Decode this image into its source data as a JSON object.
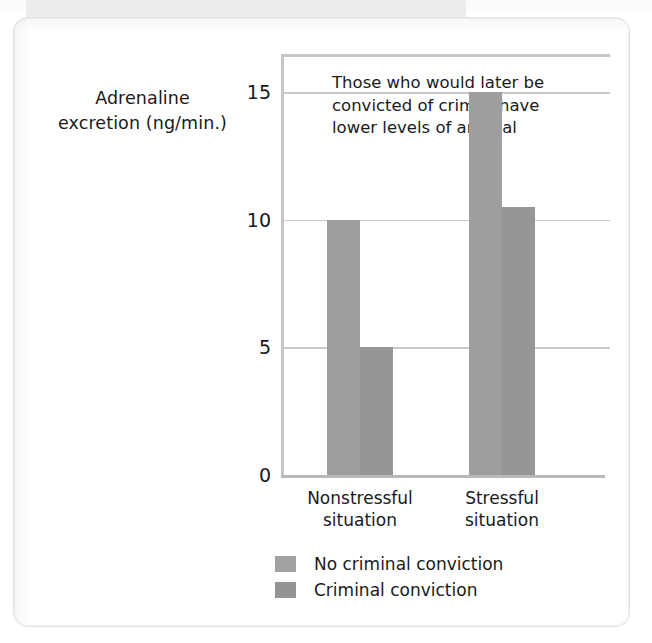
{
  "figure": {
    "y_axis_title_line1": "Adrenaline",
    "y_axis_title_line2": "excretion (ng/min.)",
    "annotation_line1": "Those who would later be",
    "annotation_line2": "convicted of crimes have",
    "annotation_line3": "lower levels of arousal"
  },
  "legend": {
    "items": [
      {
        "label": "No criminal conviction",
        "color": "#a2a2a2"
      },
      {
        "label": "Criminal conviction",
        "color": "#949494"
      }
    ]
  },
  "xticks": [
    {
      "line1": "Nonstressful",
      "line2": "situation"
    },
    {
      "line1": "Stressful",
      "line2": "situation"
    }
  ],
  "yticks": [
    "15",
    "10",
    "5",
    "0"
  ],
  "chart_data": {
    "type": "bar",
    "title": "",
    "annotation": "Those who would later be convicted of crimes have lower levels of arousal",
    "xlabel": "",
    "ylabel": "Adrenaline excretion (ng/min.)",
    "categories": [
      "Nonstressful situation",
      "Stressful situation"
    ],
    "series": [
      {
        "name": "No criminal conviction",
        "values": [
          10,
          15
        ],
        "color": "#9e9e9e"
      },
      {
        "name": "Criminal conviction",
        "values": [
          5,
          10.5
        ],
        "color": "#969696"
      }
    ],
    "ylim": [
      0,
      16.5
    ],
    "ytick_values": [
      0,
      5,
      10,
      15
    ],
    "grid": true,
    "legend_position": "bottom-left"
  }
}
